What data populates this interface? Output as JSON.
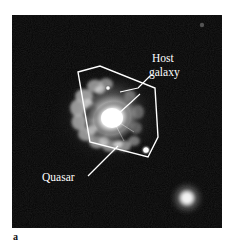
{
  "figure": {
    "letter": "a",
    "panel_background": "#ffffff",
    "photo_background": "#050505",
    "annotation_color": "#ffffff",
    "photo_bounds": {
      "x": 12,
      "y": 15,
      "width": 210,
      "height": 213
    }
  },
  "annotations": {
    "host_galaxy": {
      "line1": "Host",
      "line2": "galaxy",
      "x": 152,
      "y": 62,
      "leader": "M150,76 L138,88 L120,92"
    },
    "quasar": {
      "label": "Quasar",
      "x": 42,
      "y": 181,
      "leader": "M88,176 L92,172 L118,146"
    }
  },
  "outline": {
    "name": "host-galaxy-outline",
    "points": "78,72 100,66 155,88 158,137 148,157 90,142",
    "stroke": "#ffffff",
    "stroke_width": 1.4
  },
  "pointer_arrow": {
    "name": "quasar-core-arrow",
    "path": "M140,94 L116,116",
    "stroke": "#ffffff"
  },
  "objects": [
    {
      "name": "quasar-core",
      "cx": 112,
      "cy": 118,
      "r": 17,
      "brightness": "saturated"
    },
    {
      "name": "host-galaxy-disk",
      "cx": 107,
      "cy": 114,
      "rx": 42,
      "ry": 36,
      "brightness": "mottled"
    },
    {
      "name": "companion-blob",
      "cx": 187,
      "cy": 198,
      "r": 12,
      "brightness": "diffuse"
    },
    {
      "name": "star-point-lower-right",
      "cx": 146,
      "cy": 150,
      "r": 3,
      "brightness": "point"
    },
    {
      "name": "star-point-upper-edge",
      "cx": 108,
      "cy": 88,
      "r": 2,
      "brightness": "point"
    },
    {
      "name": "faint-speck-top-right",
      "cx": 202,
      "cy": 25,
      "r": 1.5,
      "brightness": "faint"
    }
  ]
}
